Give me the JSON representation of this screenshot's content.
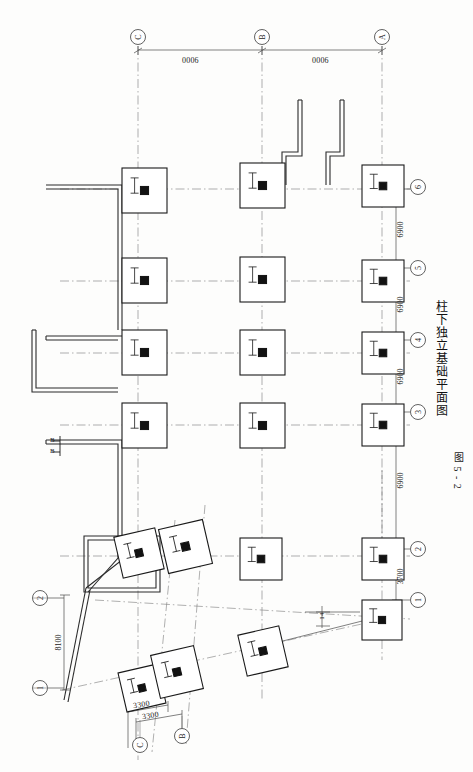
{
  "drawing": {
    "figure_number": "图 5 - 2",
    "title": "柱下独立基础平面图",
    "type": "foundation-plan"
  },
  "top_dimensions": [
    {
      "value": "0006",
      "x": 195,
      "y": 60
    },
    {
      "value": "0006",
      "x": 325,
      "y": 60
    }
  ],
  "right_dimensions": [
    {
      "value": "6900",
      "x": 403,
      "y": 228
    },
    {
      "value": "6900",
      "x": 403,
      "y": 300
    },
    {
      "value": "6900",
      "x": 403,
      "y": 372
    },
    {
      "value": "6900",
      "x": 403,
      "y": 444
    },
    {
      "value": "6900",
      "x": 403,
      "y": 516
    },
    {
      "value": "3700",
      "x": 403,
      "y": 575
    }
  ],
  "bottom_dimensions": [
    {
      "value": "3300",
      "x": 148,
      "y": 707
    },
    {
      "value": "3300",
      "x": 155,
      "y": 718
    }
  ],
  "left_dimensions": [
    {
      "value": "8100",
      "x": 56,
      "y": 640
    }
  ],
  "angle_dimensions": [
    {
      "value": "14",
      "x": 330,
      "y": 620
    }
  ],
  "top_grid_bubbles": [
    {
      "label": "C",
      "cx": 138,
      "cy": 37
    },
    {
      "label": "B",
      "cx": 262,
      "cy": 37
    },
    {
      "label": "A",
      "cx": 382,
      "cy": 37
    }
  ],
  "right_grid_bubbles": [
    {
      "label": "6",
      "cx": 418,
      "cy": 187
    },
    {
      "label": "5",
      "cx": 418,
      "cy": 268
    },
    {
      "label": "4",
      "cx": 418,
      "cy": 340
    },
    {
      "label": "3",
      "cx": 418,
      "cy": 412
    },
    {
      "label": "2",
      "cx": 418,
      "cy": 549
    },
    {
      "label": "1",
      "cx": 418,
      "cy": 600
    }
  ],
  "left_grid_bubbles": [
    {
      "label": "2",
      "cx": 40,
      "cy": 598
    },
    {
      "label": "1",
      "cx": 40,
      "cy": 688
    }
  ],
  "bottom_grid_bubbles": [
    {
      "label": "C",
      "cx": 140,
      "cy": 745
    },
    {
      "label": "B",
      "cx": 182,
      "cy": 736
    }
  ],
  "section_marker": {
    "left_label": "B",
    "right_label": "B",
    "x": 52,
    "y": 440
  },
  "footings": [
    {
      "id": "f-c6",
      "x": 122,
      "y": 168,
      "w": 45,
      "h": 45,
      "rot": 0
    },
    {
      "id": "f-b6",
      "x": 240,
      "y": 163,
      "w": 45,
      "h": 45,
      "rot": 0
    },
    {
      "id": "f-a6",
      "x": 362,
      "y": 165,
      "w": 42,
      "h": 42,
      "rot": 0
    },
    {
      "id": "f-c5",
      "x": 122,
      "y": 258,
      "w": 45,
      "h": 45,
      "rot": 0
    },
    {
      "id": "f-b5",
      "x": 240,
      "y": 257,
      "w": 45,
      "h": 45,
      "rot": 0
    },
    {
      "id": "f-a5",
      "x": 362,
      "y": 260,
      "w": 42,
      "h": 42,
      "rot": 0
    },
    {
      "id": "f-c4",
      "x": 122,
      "y": 330,
      "w": 45,
      "h": 45,
      "rot": 0
    },
    {
      "id": "f-b4",
      "x": 240,
      "y": 330,
      "w": 45,
      "h": 45,
      "rot": 0
    },
    {
      "id": "f-a4",
      "x": 362,
      "y": 332,
      "w": 42,
      "h": 42,
      "rot": 0
    },
    {
      "id": "f-c3",
      "x": 122,
      "y": 403,
      "w": 45,
      "h": 45,
      "rot": 0
    },
    {
      "id": "f-b3",
      "x": 240,
      "y": 403,
      "w": 45,
      "h": 45,
      "rot": 0
    },
    {
      "id": "f-a3",
      "x": 362,
      "y": 404,
      "w": 42,
      "h": 42,
      "rot": 0
    },
    {
      "id": "f-c2",
      "x": 118,
      "y": 532,
      "w": 42,
      "h": 42,
      "rot": -13
    },
    {
      "id": "f-b2",
      "x": 163,
      "y": 524,
      "w": 45,
      "h": 45,
      "rot": -13
    },
    {
      "id": "f-m2",
      "x": 240,
      "y": 538,
      "w": 42,
      "h": 42,
      "rot": 0
    },
    {
      "id": "f-a2",
      "x": 362,
      "y": 538,
      "w": 42,
      "h": 42,
      "rot": 0
    },
    {
      "id": "f-c1",
      "x": 122,
      "y": 668,
      "w": 40,
      "h": 40,
      "rot": -13
    },
    {
      "id": "f-b1",
      "x": 155,
      "y": 650,
      "w": 44,
      "h": 44,
      "rot": -13
    },
    {
      "id": "f-m1",
      "x": 242,
      "y": 630,
      "w": 42,
      "h": 42,
      "rot": -13
    },
    {
      "id": "f-a1",
      "x": 362,
      "y": 600,
      "w": 40,
      "h": 40,
      "rot": 0
    }
  ],
  "colors": {
    "line": "#1a1a1a",
    "centerline": "#6f6f6f",
    "wall": "#2a2a2a",
    "pier": "#111111",
    "paper": "#fdfdfc"
  }
}
